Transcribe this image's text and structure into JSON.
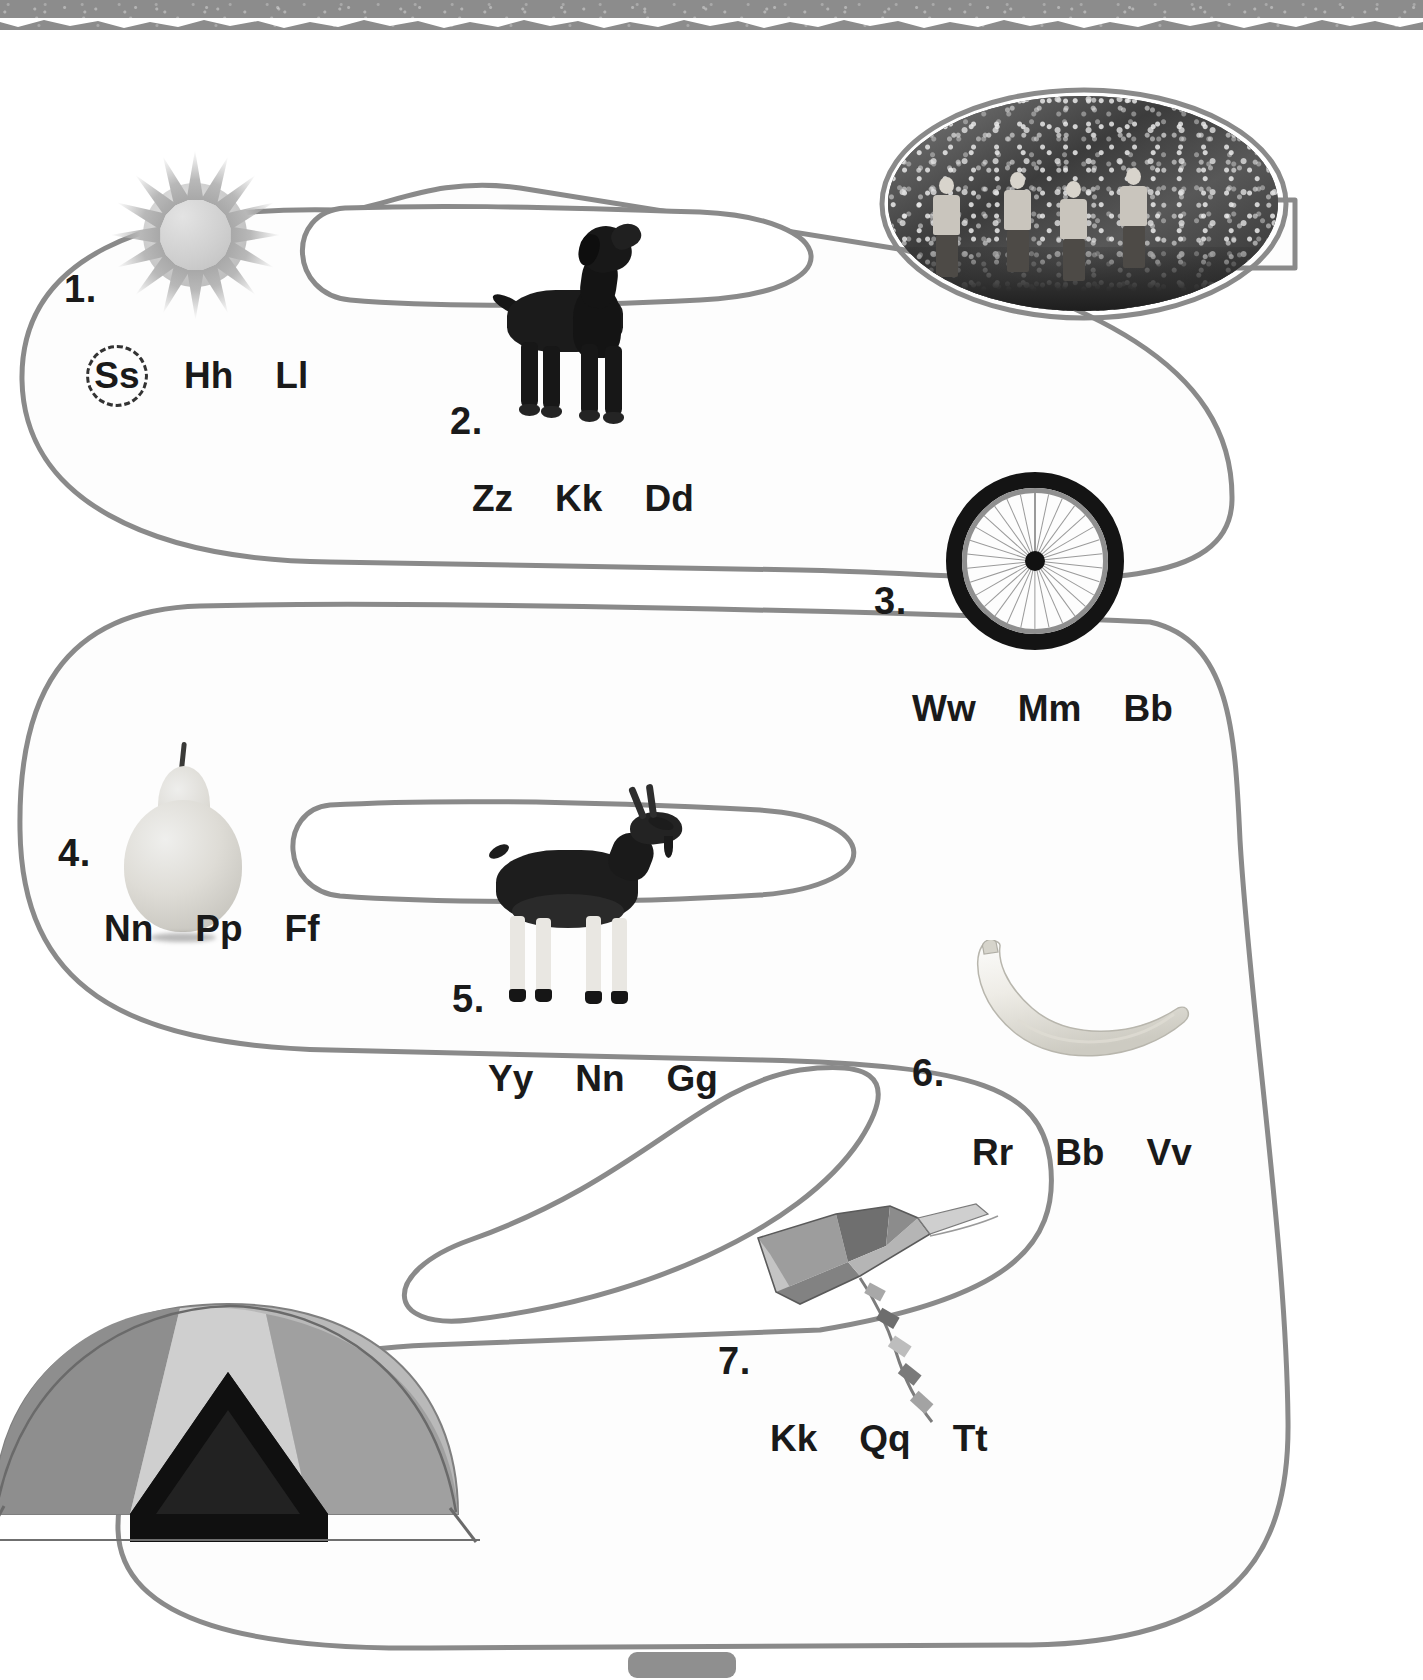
{
  "worksheet": {
    "title": "Beginning Sounds Path Activity",
    "path_type": "winding-s-path",
    "items": [
      {
        "number": "1.",
        "picture": "sun",
        "picture_label": "sun",
        "choices": [
          {
            "text": "Ss",
            "circled": true
          },
          {
            "text": "Hh",
            "circled": false
          },
          {
            "text": "Ll",
            "circled": false
          }
        ]
      },
      {
        "number": "2.",
        "picture": "dog",
        "picture_label": "dog",
        "choices": [
          {
            "text": "Zz",
            "circled": false
          },
          {
            "text": "Kk",
            "circled": false
          },
          {
            "text": "Dd",
            "circled": false
          }
        ]
      },
      {
        "number": "3.",
        "picture": "wheel",
        "picture_label": "bicycle wheel",
        "choices": [
          {
            "text": "Ww",
            "circled": false
          },
          {
            "text": "Mm",
            "circled": false
          },
          {
            "text": "Bb",
            "circled": false
          }
        ]
      },
      {
        "number": "4.",
        "picture": "pear",
        "picture_label": "pear",
        "choices": [
          {
            "text": "Nn",
            "circled": false
          },
          {
            "text": "Pp",
            "circled": false
          },
          {
            "text": "Ff",
            "circled": false
          }
        ]
      },
      {
        "number": "5.",
        "picture": "goat",
        "picture_label": "goat",
        "choices": [
          {
            "text": "Yy",
            "circled": false
          },
          {
            "text": "Nn",
            "circled": false
          },
          {
            "text": "Gg",
            "circled": false
          }
        ]
      },
      {
        "number": "6.",
        "picture": "banana",
        "picture_label": "banana",
        "choices": [
          {
            "text": "Rr",
            "circled": false
          },
          {
            "text": "Bb",
            "circled": false
          },
          {
            "text": "Vv",
            "circled": false
          }
        ]
      },
      {
        "number": "7.",
        "picture": "kite",
        "picture_label": "kite",
        "choices": [
          {
            "text": "Kk",
            "circled": false
          },
          {
            "text": "Qq",
            "circled": false
          },
          {
            "text": "Tt",
            "circled": false
          }
        ]
      }
    ],
    "photo": {
      "caption": "",
      "subject": "four children hiking on a forest trail"
    },
    "end_picture": {
      "picture": "tent",
      "picture_label": "tent"
    },
    "colors": {
      "path_stroke": "#8a8a8a",
      "text": "#1a1a1a",
      "torn_edge": "#8c8c8c",
      "circle_marker": "#333333",
      "page_background": "#ffffff"
    }
  }
}
